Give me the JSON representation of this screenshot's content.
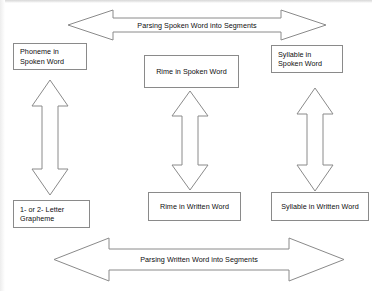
{
  "diagram": {
    "colors": {
      "background": "#ffffff",
      "stroke": "#8a8a8a",
      "text": "#0d0d0d"
    },
    "top_band": {
      "label": "Parsing Spoken Word into Segments",
      "direction": "double-headed-horizontal"
    },
    "bottom_band": {
      "label": "Parsing Written Word into Segments",
      "direction": "double-headed-horizontal"
    },
    "columns": [
      {
        "id": "phoneme-grapheme",
        "spoken": {
          "line1": "Phoneme in",
          "line2": "Spoken Word"
        },
        "written": {
          "line1": "1- or 2- Letter",
          "line2": "Grapheme"
        },
        "connector": "double-headed-vertical"
      },
      {
        "id": "rime",
        "spoken": {
          "line1": "Rime in Spoken Word",
          "line2": ""
        },
        "written": {
          "line1": "Rime in Written Word",
          "line2": ""
        },
        "connector": "double-headed-vertical"
      },
      {
        "id": "syllable",
        "spoken": {
          "line1": "Syllable in",
          "line2": "Spoken Word"
        },
        "written": {
          "line1": "Syllable in Written Word",
          "line2": ""
        },
        "connector": "double-headed-vertical"
      }
    ]
  }
}
